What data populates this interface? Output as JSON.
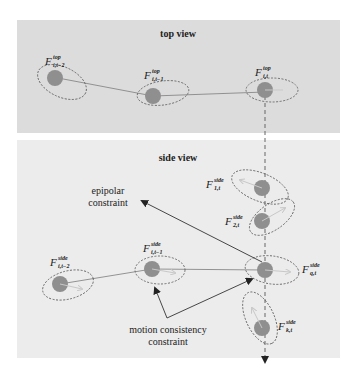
{
  "panels": {
    "top": {
      "title": "top view",
      "background": "#dcdcdc"
    },
    "side": {
      "title": "side view",
      "background": "#ececec"
    }
  },
  "colors": {
    "node_fill": "#8f8f8f",
    "ellipse_stroke": "#555555",
    "edge_stroke": "#888888",
    "arrow_stroke": "#333333",
    "direction_arrow": "#c8c8c8"
  },
  "top_nodes": [
    {
      "id": "top-i-t-2",
      "label": {
        "main": "F",
        "sup": "top",
        "sub": "i,t−2"
      }
    },
    {
      "id": "top-i-t-1",
      "label": {
        "main": "F",
        "sup": "top",
        "sub": "i,t−1"
      }
    },
    {
      "id": "top-i-t",
      "label": {
        "main": "F",
        "sup": "top",
        "sub": "i,t"
      }
    }
  ],
  "side_nodes": [
    {
      "id": "side-1-t",
      "label": {
        "main": "F",
        "sup": "side",
        "sub": "1,t"
      }
    },
    {
      "id": "side-2-t",
      "label": {
        "main": "F",
        "sup": "side",
        "sub": "2,t"
      }
    },
    {
      "id": "side-j-t-2",
      "label": {
        "main": "F",
        "sup": "side",
        "sub": "i,t−2"
      }
    },
    {
      "id": "side-j-t-1",
      "label": {
        "main": "F",
        "sup": "side",
        "sub": "i,t−1"
      }
    },
    {
      "id": "side-q-t",
      "label": {
        "main": "F",
        "sup": "side",
        "sub": "q,t"
      }
    },
    {
      "id": "side-k-t",
      "label": {
        "main": "F",
        "sup": "side",
        "sub": "k,t"
      }
    }
  ],
  "annotations": {
    "epipolar": {
      "line1": "epipolar",
      "line2": "constraint"
    },
    "motion": {
      "line1": "motion consistency",
      "line2": "constraint"
    }
  }
}
